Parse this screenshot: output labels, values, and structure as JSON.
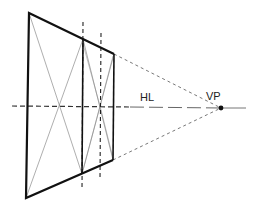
{
  "diagram": {
    "labels": {
      "horizon_line": "HL",
      "vanishing_point": "VP"
    },
    "colors": {
      "stroke": "#111111",
      "thin": "#555555",
      "dashed": "#333333",
      "background": "#ffffff"
    },
    "points": {
      "vp": [
        221,
        108
      ],
      "outer_top_left": [
        29,
        13
      ],
      "outer_bottom_left": [
        26,
        198
      ],
      "front_top": [
        83,
        39
      ],
      "front_bottom": [
        82,
        174
      ],
      "back_top": [
        114,
        54
      ],
      "back_bottom": [
        113,
        160
      ]
    }
  }
}
